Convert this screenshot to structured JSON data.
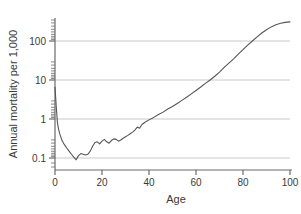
{
  "chart_data": {
    "type": "line",
    "title": "",
    "xlabel": "Age",
    "ylabel": "Annual mortality per 1,000",
    "xlim": [
      0,
      100
    ],
    "ylim": [
      0.06,
      600
    ],
    "yscale": "log",
    "xscale": "linear",
    "grid": "horizontal-major",
    "legend": "none",
    "xticks": [
      0,
      20,
      40,
      60,
      80,
      100
    ],
    "xtick_labels": [
      "0",
      "20",
      "40",
      "60",
      "80",
      "100"
    ],
    "yticks": [
      0.1,
      1,
      10,
      100
    ],
    "ytick_labels": [
      "0.1",
      "1",
      "10",
      "100"
    ],
    "series": [
      {
        "name": "Annual mortality per 1,000",
        "color": "#555555",
        "x": [
          0,
          0.5,
          1,
          1.5,
          2,
          3,
          4,
          5,
          6,
          7,
          8,
          9,
          10,
          11,
          12,
          13,
          14,
          15,
          16,
          17,
          18,
          19,
          20,
          21,
          22,
          23,
          24,
          25,
          26,
          27,
          28,
          29,
          30,
          31,
          32,
          33,
          34,
          35,
          36,
          37,
          38,
          39,
          40,
          42,
          44,
          46,
          48,
          50,
          52,
          54,
          56,
          58,
          60,
          62,
          64,
          66,
          68,
          70,
          72,
          74,
          76,
          78,
          80,
          82,
          84,
          86,
          88,
          90,
          92,
          94,
          96,
          98,
          100
        ],
        "y": [
          6.5,
          2.2,
          0.85,
          0.55,
          0.42,
          0.28,
          0.22,
          0.18,
          0.15,
          0.125,
          0.105,
          0.09,
          0.115,
          0.13,
          0.125,
          0.12,
          0.125,
          0.15,
          0.2,
          0.25,
          0.26,
          0.23,
          0.27,
          0.3,
          0.26,
          0.24,
          0.28,
          0.31,
          0.3,
          0.27,
          0.29,
          0.32,
          0.35,
          0.38,
          0.42,
          0.46,
          0.52,
          0.62,
          0.58,
          0.72,
          0.8,
          0.88,
          0.95,
          1.1,
          1.3,
          1.5,
          1.8,
          2.1,
          2.5,
          3.0,
          3.6,
          4.4,
          5.4,
          6.6,
          8.2,
          10.0,
          12.5,
          16.0,
          21.0,
          27.0,
          35.0,
          46.0,
          60.0,
          78.0,
          100.0,
          128.0,
          160.0,
          195.0,
          230.0,
          260.0,
          285.0,
          300.0,
          310.0
        ]
      }
    ]
  },
  "axes": {
    "y_title": "Annual mortality per 1,000",
    "x_title": "Age"
  }
}
